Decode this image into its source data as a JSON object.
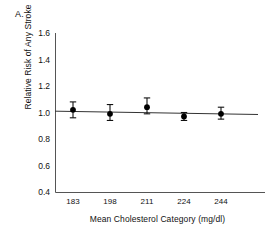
{
  "figure": {
    "panel_label": "A."
  },
  "chart_data": {
    "type": "scatter",
    "title": "",
    "panel": "A.",
    "xlabel": "Mean Cholesterol Category (mg/dl)",
    "ylabel": "Relative Risk of Any Stroke",
    "categories": [
      "183",
      "198",
      "211",
      "224",
      "244"
    ],
    "x": [
      183,
      198,
      211,
      224,
      244
    ],
    "values": [
      1.02,
      0.99,
      1.04,
      0.97,
      0.99
    ],
    "error_low": [
      0.96,
      0.94,
      0.99,
      0.94,
      0.95
    ],
    "error_high": [
      1.08,
      1.06,
      1.11,
      1.0,
      1.04
    ],
    "error_bars": [
      {
        "category": "183",
        "value": 1.02,
        "low": 0.96,
        "high": 1.08
      },
      {
        "category": "198",
        "value": 0.99,
        "low": 0.94,
        "high": 1.06
      },
      {
        "category": "211",
        "value": 1.04,
        "low": 0.99,
        "high": 1.11
      },
      {
        "category": "224",
        "value": 0.97,
        "low": 0.94,
        "high": 1.0
      },
      {
        "category": "244",
        "value": 0.99,
        "low": 0.95,
        "high": 1.04
      }
    ],
    "reference_line": {
      "label": "trend line",
      "y_start": 1.01,
      "y_end": 0.985
    },
    "ylim": [
      0.4,
      1.6
    ],
    "yticks": [
      "0.4",
      "0.6",
      "0.8",
      "1.0",
      "1.2",
      "1.4",
      "1.6"
    ],
    "ytick_values": [
      0.4,
      0.6,
      0.8,
      1.0,
      1.2,
      1.4,
      1.6
    ],
    "xticks": [
      "183",
      "198",
      "211",
      "224",
      "244"
    ],
    "grid": false,
    "legend": "none",
    "marker_color": "#000000",
    "line_color": "#333333",
    "axis_color": "#555555"
  }
}
